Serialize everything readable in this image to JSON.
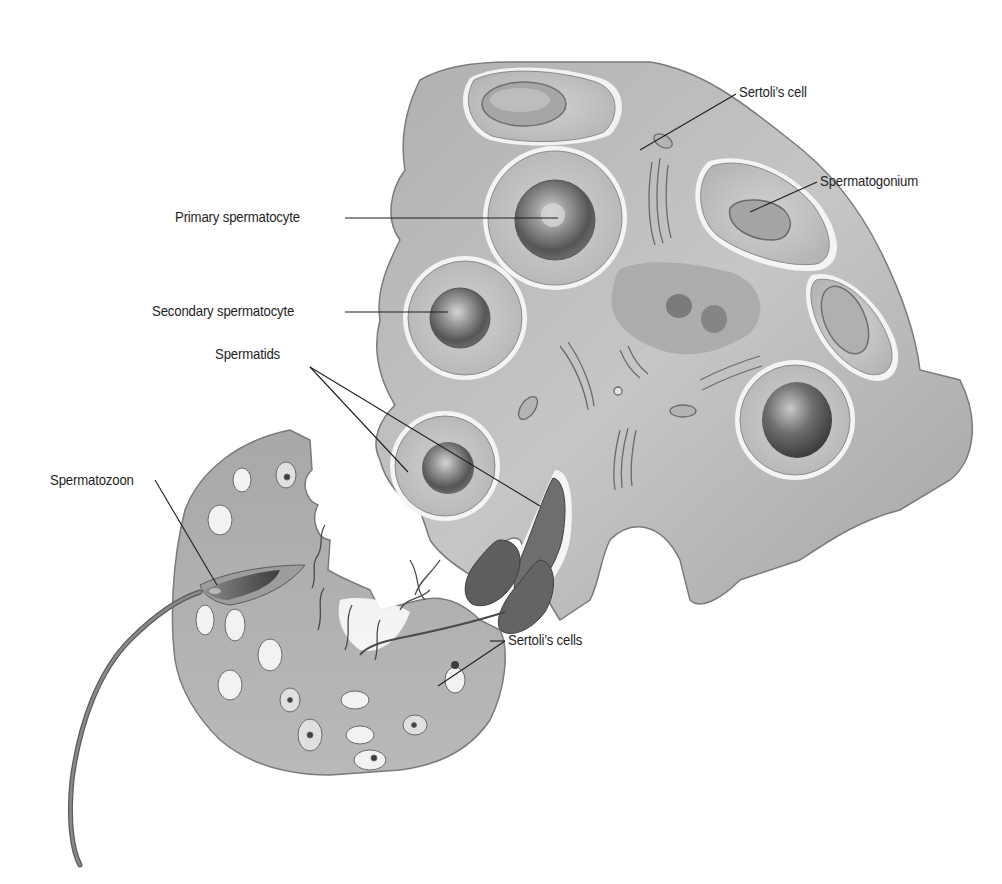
{
  "figure": {
    "colors": {
      "background": "#ffffff",
      "sertoli_fill": "#b8b8b8",
      "sertoli_shadow": "#8e8e8e",
      "cell_fill": "#c8c8c8",
      "nucleus_dark": "#5a5a5a",
      "membrane_white": "#f4f4f4",
      "leader_line": "#1e1e1e",
      "label_text": "#1e1e1e"
    }
  },
  "labels": {
    "sertoli_cell": "Sertoli’s cell",
    "spermatogonium": "Spermatogonium",
    "primary_spermatocyte": "Primary spermatocyte",
    "secondary_spermatocyte": "Secondary spermatocyte",
    "spermatids": "Spermatids",
    "spermatozoon": "Spermatozoon",
    "sertoli_cells": "Sertoli’s cells"
  }
}
